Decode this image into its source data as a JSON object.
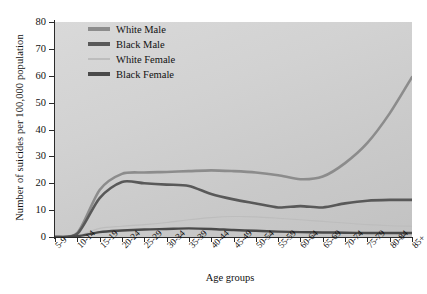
{
  "chart_data": {
    "type": "line",
    "title": "",
    "xlabel": "Age groups",
    "ylabel": "Number of suicides per 100,000 population",
    "ylim": [
      0,
      80
    ],
    "yticks": [
      0,
      10,
      20,
      30,
      40,
      50,
      60,
      70,
      80
    ],
    "grid": false,
    "legend_position": "top-left-inside",
    "categories": [
      "5-9",
      "10-14",
      "15-19",
      "20-24",
      "25-29",
      "30-34",
      "35-39",
      "40-44",
      "45-49",
      "50-54",
      "55-59",
      "60-64",
      "65-69",
      "70-74",
      "75-79",
      "80-84",
      "85+"
    ],
    "series": [
      {
        "name": "White Male",
        "color": "#8c8c8c",
        "values": [
          0,
          1.5,
          17.5,
          23.5,
          24.0,
          24.2,
          24.5,
          24.8,
          24.5,
          24.0,
          23.0,
          21.5,
          22.5,
          27.5,
          35.0,
          46.0,
          59.5
        ]
      },
      {
        "name": "Black Male",
        "color": "#595959",
        "values": [
          0,
          1.2,
          14.5,
          20.5,
          20.0,
          19.5,
          19.0,
          16.0,
          14.0,
          12.5,
          11.0,
          11.5,
          11.0,
          12.5,
          13.5,
          13.8,
          13.8
        ]
      },
      {
        "name": "White Female",
        "color": "#bdbdbd",
        "values": [
          0,
          0.4,
          3.2,
          4.0,
          4.6,
          5.4,
          6.4,
          7.2,
          7.6,
          7.5,
          7.0,
          6.4,
          5.8,
          5.2,
          4.6,
          4.2,
          4.0
        ]
      },
      {
        "name": "Black Female",
        "color": "#4a4a4a",
        "values": [
          0,
          0.3,
          1.8,
          2.4,
          2.8,
          3.0,
          3.2,
          3.0,
          2.6,
          2.3,
          2.0,
          1.8,
          1.7,
          1.6,
          1.5,
          1.5,
          1.5
        ]
      }
    ]
  }
}
